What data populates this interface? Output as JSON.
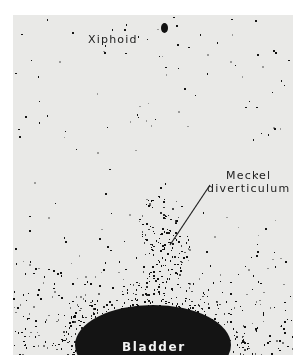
{
  "image": {
    "type": "nuclear medicine scintigraphy scan",
    "background_color": "#e9e9e7",
    "uptake_color": "#111111"
  },
  "labels": {
    "xiphoid": "Xiphoid",
    "meckel_line1": "Meckel",
    "meckel_line2": "diverticulum",
    "bladder": "Bladder"
  }
}
